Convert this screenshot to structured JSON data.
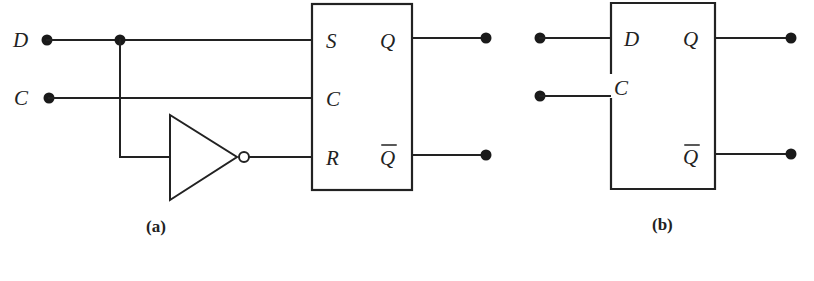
{
  "diagram": {
    "type": "logic-circuit",
    "subfigures": [
      {
        "id": "a",
        "caption": "(a)",
        "inputs": [
          {
            "label": "D"
          },
          {
            "label": "C"
          }
        ],
        "gate": {
          "type": "inverter"
        },
        "flipflop": {
          "type": "SR",
          "pins_left": [
            "S",
            "C",
            "R"
          ],
          "pins_right": [
            "Q",
            "Q"
          ],
          "inverted_output_index": 1
        }
      },
      {
        "id": "b",
        "caption": "(b)",
        "flipflop": {
          "type": "D",
          "pins_left": [
            "D",
            "C"
          ],
          "pins_right": [
            "Q",
            "Q"
          ],
          "inverted_output_index": 1
        }
      }
    ]
  }
}
